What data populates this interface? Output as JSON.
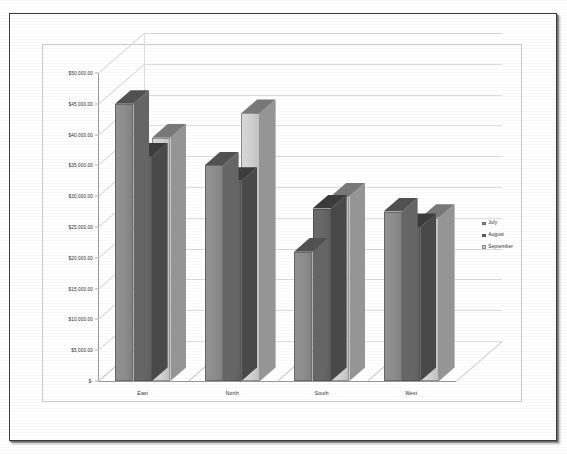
{
  "chart_data": {
    "type": "bar",
    "title": "",
    "xlabel": "",
    "ylabel": "",
    "categories": [
      "East",
      "North",
      "South",
      "West"
    ],
    "series": [
      {
        "name": "July",
        "color": "#8c8c8c",
        "values": [
          45000,
          35000,
          21000,
          27500
        ]
      },
      {
        "name": "August",
        "color": "#666666",
        "values": [
          36500,
          32500,
          28000,
          25000
        ]
      },
      {
        "name": "September",
        "color": "#cfcfcf",
        "values": [
          39500,
          43500,
          30000,
          26500
        ]
      }
    ],
    "ylim": [
      0,
      50000
    ],
    "ytick_values": [
      0,
      5000,
      10000,
      15000,
      20000,
      25000,
      30000,
      35000,
      40000,
      45000,
      50000
    ],
    "ytick_labels": [
      "$-",
      "$5,000.00",
      "$10,000.00",
      "$15,000.00",
      "$20,000.00",
      "$25,000.00",
      "$30,000.00",
      "$35,000.00",
      "$40,000.00",
      "$45,000.00",
      "$50,000.00"
    ],
    "grid": true,
    "legend_position": "right",
    "projection": "3d-clustered-column"
  },
  "legend": {
    "entries": [
      {
        "label": "July",
        "color": "#8c8c8c"
      },
      {
        "label": "August",
        "color": "#666666"
      },
      {
        "label": "September",
        "color": "#cfcfcf"
      }
    ]
  }
}
